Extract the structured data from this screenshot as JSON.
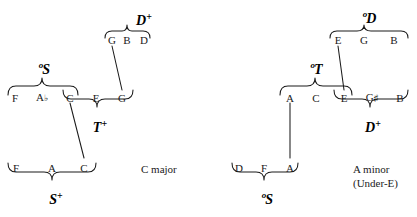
{
  "diagram": {
    "title_visible": false,
    "ink_color": "#1b1b1b",
    "background": "#ffffff"
  },
  "left_system": {
    "caption": "C major",
    "rows": {
      "top": {
        "label": "D+",
        "label_prefix": "",
        "label_superscript": "+",
        "notes": [
          "G",
          "B",
          "D"
        ]
      },
      "middle_upper_group": {
        "label": "°S",
        "label_prefix": "o",
        "label_superscript": "",
        "notes": [
          "F",
          "A♭",
          "C"
        ]
      },
      "middle_lower_group": {
        "label": "T+",
        "label_prefix": "",
        "label_superscript": "+",
        "notes": [
          "C",
          "E",
          "G"
        ]
      },
      "bottom": {
        "label": "S+",
        "label_prefix": "",
        "label_superscript": "+",
        "notes": [
          "F",
          "A",
          "C"
        ]
      }
    },
    "middle_row_notes": [
      "F",
      "A♭",
      "C",
      "E",
      "G"
    ]
  },
  "right_system": {
    "caption_line1": "A minor",
    "caption_line2": "(Under-E)",
    "rows": {
      "top": {
        "label": "°D",
        "label_prefix": "o",
        "label_superscript": "",
        "notes": [
          "E",
          "G",
          "B"
        ]
      },
      "middle_upper_group": {
        "label": "°T",
        "label_prefix": "o",
        "label_superscript": "",
        "notes": [
          "A",
          "C",
          "E"
        ]
      },
      "middle_lower_group": {
        "label": "D+",
        "label_prefix": "",
        "label_superscript": "+",
        "notes": [
          "E",
          "G♯",
          "B"
        ]
      },
      "bottom": {
        "label": "°S",
        "label_prefix": "o",
        "label_superscript": "",
        "notes": [
          "D",
          "F",
          "A"
        ]
      }
    },
    "middle_row_notes": [
      "A",
      "C",
      "E",
      "G♯",
      "B"
    ]
  },
  "notes_flat": {
    "L_top_1": "G",
    "L_top_2": "B",
    "L_top_3": "D",
    "L_mid_1": "F",
    "L_mid_2": "A",
    "L_mid_2_acc": "♭",
    "L_mid_3": "C",
    "L_mid_4": "E",
    "L_mid_5": "G",
    "L_bot_1": "F",
    "L_bot_2": "A",
    "L_bot_3": "C",
    "R_top_1": "E",
    "R_top_2": "G",
    "R_top_3": "B",
    "R_mid_1": "A",
    "R_mid_2": "C",
    "R_mid_3": "E",
    "R_mid_4": "G",
    "R_mid_4_acc": "♯",
    "R_mid_5": "B",
    "R_bot_1": "D",
    "R_bot_2": "F",
    "R_bot_3": "A"
  },
  "labels_flat": {
    "L_Dplus_main": "D",
    "L_Dplus_sup": "+",
    "L_oS_pre": "o",
    "L_oS_main": "S",
    "L_Tplus_main": "T",
    "L_Tplus_sup": "+",
    "L_Splus_main": "S",
    "L_Splus_sup": "+",
    "R_oD_pre": "o",
    "R_oD_main": "D",
    "R_oT_pre": "o",
    "R_oT_main": "T",
    "R_Dplus_main": "D",
    "R_Dplus_sup": "+",
    "R_oS_pre": "o",
    "R_oS_main": "S"
  },
  "captions_flat": {
    "left": "C major",
    "right_1": "A minor",
    "right_2": "(Under-E)"
  }
}
